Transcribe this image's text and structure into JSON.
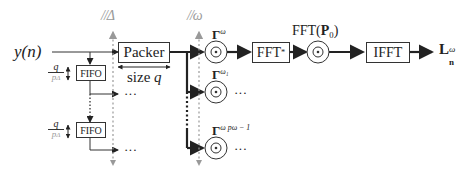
{
  "diagram": {
    "input_label": "y(n)",
    "packer": {
      "label": "Packer",
      "size_label": "size",
      "size_var": "q"
    },
    "fifo": [
      {
        "label": "FIFO",
        "rate_num": "q",
        "rate_den": "p",
        "rate_den_sub": "Δ"
      },
      {
        "label": "FIFO",
        "rate_num": "q",
        "rate_den": "p",
        "rate_den_sub": "Δ"
      }
    ],
    "parallel_delta": "//Δ",
    "parallel_omega": "//ω",
    "gamma_nodes": [
      {
        "symbol": "Γ",
        "superscript": "ω",
        "continues": false
      },
      {
        "symbol": "Γ",
        "superscript": "ω₁",
        "continues": true
      },
      {
        "symbol": "Γ",
        "superscript": "ω pω − 1",
        "continues": true
      }
    ],
    "ellipsis": "···",
    "fft_conj": {
      "label": "FFT",
      "superscript": "*"
    },
    "fft_p0": {
      "label": "FFT(",
      "bold": "P",
      "sub": "0",
      "close": ")"
    },
    "ifft": {
      "label": "IFFT"
    },
    "output": {
      "symbol": "L",
      "subscript": "n",
      "superscript": "ω"
    },
    "colors": {
      "line": "#333333",
      "thick": "#222222",
      "dashed": "#9a9a9a"
    }
  }
}
